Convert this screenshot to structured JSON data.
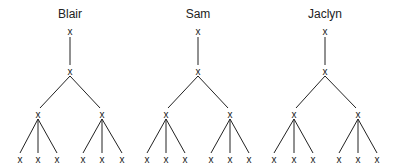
{
  "trees": [
    {
      "label": "Blair",
      "root_x": 70,
      "mid_nodes": [
        38,
        102
      ],
      "leaves": [
        20,
        38,
        57,
        83,
        102,
        122
      ]
    },
    {
      "label": "Sam",
      "root_x": 198,
      "mid_nodes": [
        166,
        230
      ],
      "leaves": [
        147,
        166,
        185,
        211,
        230,
        249
      ]
    },
    {
      "label": "Jaclyn",
      "root_x": 325,
      "mid_nodes": [
        294,
        358
      ],
      "leaves": [
        274,
        294,
        313,
        339,
        358,
        377
      ]
    }
  ],
  "node_symbol": "x",
  "levels_y": {
    "label": 18,
    "root": 31,
    "second": 71,
    "third": 114,
    "leaf": 159
  }
}
